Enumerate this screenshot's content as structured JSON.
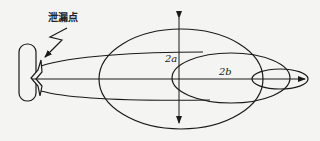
{
  "diagram": {
    "type": "gas leak dispersion cloud diagram",
    "labels": {
      "leak_point": "泄漏点",
      "axis_a": "2a",
      "axis_b": "2b"
    },
    "colors": {
      "stroke": "#1a1a1a",
      "background": "#f4f4f2"
    },
    "shapes": {
      "source_box": {
        "x": 19,
        "y": 44,
        "w": 17,
        "h": 57
      },
      "large_ellipse": {
        "cx": 181,
        "cy": 79,
        "rx": 82,
        "ry": 50
      },
      "medium_ellipse": {
        "cx": 231,
        "cy": 78,
        "rx": 59,
        "ry": 25
      },
      "small_ellipse": {
        "cx": 280,
        "cy": 79,
        "rx": 28,
        "ry": 10
      },
      "wind_axis": {
        "x1": 32,
        "y1": 79,
        "x2": 305,
        "y2": 79
      },
      "vertical_axis": {
        "x": 179,
        "y1": 16,
        "y2": 125
      }
    }
  }
}
